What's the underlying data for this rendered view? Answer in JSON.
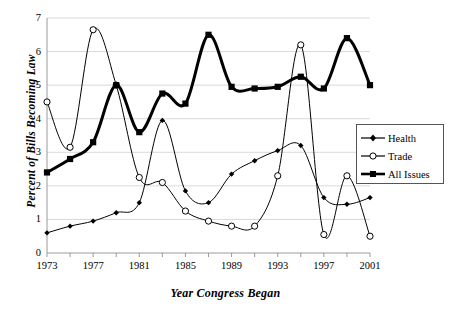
{
  "chart_data": {
    "type": "line",
    "title": "",
    "xlabel": "Year Congress Began",
    "ylabel": "Percent of Bills Becoming Law",
    "xlim": [
      1973,
      2001
    ],
    "ylim": [
      0,
      7
    ],
    "grid": true,
    "legend_position": "right-middle",
    "xticks": [
      "1973",
      "1977",
      "1981",
      "1985",
      "1989",
      "1993",
      "1997",
      "2001"
    ],
    "xtick_values": [
      1973,
      1977,
      1981,
      1985,
      1989,
      1993,
      1997,
      2001
    ],
    "xminor_step": 2,
    "yticks": [
      "0",
      "1",
      "2",
      "3",
      "4",
      "5",
      "6",
      "7"
    ],
    "ytick_values": [
      0,
      1,
      2,
      3,
      4,
      5,
      6,
      7
    ],
    "x": [
      1973,
      1975,
      1977,
      1979,
      1981,
      1983,
      1985,
      1987,
      1989,
      1991,
      1993,
      1995,
      1997,
      1999,
      2001
    ],
    "series": [
      {
        "name": "Health",
        "marker": "filled-diamond",
        "line_width": 1,
        "color": "#000000",
        "values": [
          0.6,
          0.8,
          0.95,
          1.2,
          1.5,
          3.95,
          1.85,
          1.5,
          2.35,
          2.75,
          3.05,
          3.2,
          1.65,
          1.45,
          1.65
        ]
      },
      {
        "name": "Trade",
        "marker": "open-circle",
        "line_width": 1,
        "color": "#000000",
        "values": [
          4.5,
          3.15,
          6.65,
          5.0,
          2.25,
          2.1,
          1.25,
          0.95,
          0.8,
          0.8,
          2.3,
          6.2,
          0.55,
          2.3,
          0.5
        ]
      },
      {
        "name": "All Issues",
        "marker": "filled-square",
        "line_width": 3,
        "color": "#000000",
        "values": [
          2.4,
          2.8,
          3.3,
          5.0,
          3.6,
          4.75,
          4.45,
          6.5,
          4.95,
          4.9,
          4.95,
          5.25,
          4.9,
          6.4,
          5.0
        ]
      }
    ],
    "legend_entries": [
      "Health",
      "Trade",
      "All Issues"
    ]
  }
}
